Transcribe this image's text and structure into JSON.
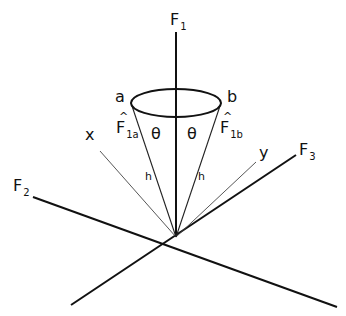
{
  "diagram": {
    "axes": {
      "f1": {
        "label": "F",
        "subscript": "1"
      },
      "f2": {
        "label": "F",
        "subscript": "2"
      },
      "f3": {
        "label": "F",
        "subscript": "3"
      }
    },
    "auxiliary_lines": {
      "x": {
        "label": "x"
      },
      "y": {
        "label": "y"
      }
    },
    "cone": {
      "point_a": "a",
      "point_b": "b",
      "angle_left": "θ",
      "angle_right": "θ",
      "height_left": "h",
      "height_right": "h",
      "vector_a": {
        "hat": "^",
        "label": "F",
        "subscript": "1a"
      },
      "vector_b": {
        "hat": "^",
        "label": "F",
        "subscript": "1b"
      }
    },
    "colors": {
      "line": "#111111",
      "background": "#ffffff"
    }
  }
}
